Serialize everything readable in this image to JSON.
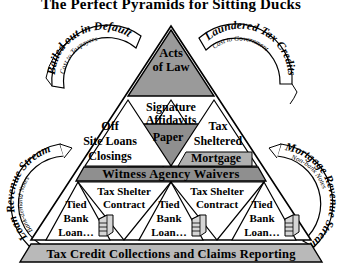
{
  "title": "The Perfect Pyramids for Sitting Ducks",
  "colors": {
    "ink": "#000000",
    "apex_fill": "#9a9a9a",
    "paper_fill": "#8f8f8f",
    "band_fill": "#8f8f8f",
    "base_fill": "#b9b9b9",
    "mortgage_fill": "#b0b0b0",
    "page_bg": "#ffffff"
  },
  "pyramid": {
    "apex": {
      "line1": "Acts",
      "line2": "of Law"
    },
    "tier2": {
      "center_top_line1": "Signature",
      "center_top_line2": "Affidavits",
      "center_inverted": "Paper",
      "left_line1": "Off",
      "left_line2": "Site Loans",
      "left_line3": "Closings",
      "right_line1": "Tax",
      "right_line2": "Sheltered",
      "right_line3": "Mortgage"
    },
    "band": {
      "label": "Witness Agency Waivers"
    },
    "tier3": {
      "contract_label_line1": "Tax Shelter",
      "contract_label_line2": "Contract",
      "loan_label_line1": "Tied",
      "loan_label_line2": "Bank",
      "loan_label_line3": "Loan…",
      "contracts": [
        {
          "line1": "Tax Shelter",
          "line2": "Contract"
        },
        {
          "line1": "Tax Shelter",
          "line2": "Contract"
        }
      ],
      "loans": [
        {
          "line1": "Tied",
          "line2": "Bank",
          "line3": "Loan…",
          "icon": "server-building-icon"
        },
        {
          "line1": "Tied",
          "line2": "Bank",
          "line3": "Loan…",
          "icon": "server-building-icon"
        },
        {
          "line1": "Tied",
          "line2": "Bank",
          "line3": "Loan…",
          "icon": "server-building-icon"
        }
      ]
    },
    "base": {
      "label": "Tax Credit Collections and Claims Reporting"
    }
  },
  "ribbons": {
    "top_left": {
      "main": "Bailed out in Default",
      "sub": "Cost to Taxpayers"
    },
    "top_right": {
      "main": "Laundered Tax Credits",
      "sub": "Cost to Government"
    },
    "left": {
      "main": "Loan Revenue Stream",
      "sub": "Bank-demand Notes"
    },
    "right": {
      "main": "Mortgage Revenue Stream",
      "sub": "Non-bank Notes"
    }
  }
}
